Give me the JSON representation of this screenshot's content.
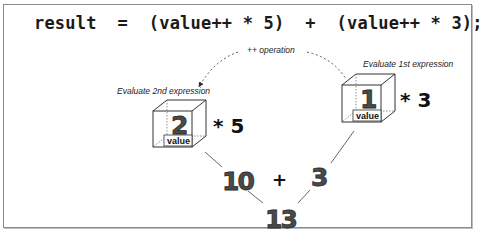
{
  "code_line": "result  =  (value++ * 5)  +  (value++ * 3);",
  "annotations": {
    "operation": "++ operation",
    "eval_first": "Evaluate 1st expression",
    "eval_second": "Evaluate 2nd expression"
  },
  "cubes": {
    "first": {
      "number": "1",
      "label": "value",
      "multiplier": "* 3"
    },
    "second": {
      "number": "2",
      "label": "value",
      "multiplier": "* 5"
    }
  },
  "results": {
    "left_product": "10",
    "operator": "+",
    "right_product": "3",
    "sum": "13"
  },
  "colors": {
    "number_fill": "#4a4a4a",
    "line": "#555555",
    "frame": "#8a8a8a"
  }
}
